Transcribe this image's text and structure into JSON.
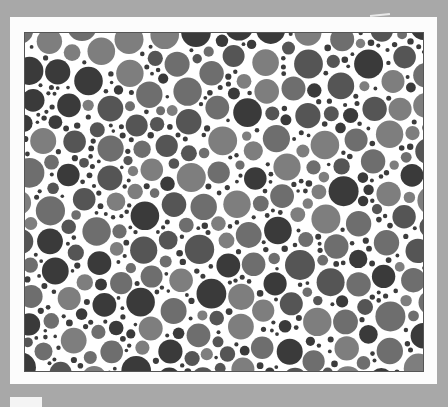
{
  "image": {
    "description": "Grayscale scan of a pseudo-isochromatic dot plate (Ishihara-style) mounted on a white card over a gray background",
    "background_color": "#a8a8a8",
    "card_color": "#fcfcfc",
    "panel_border_color": "#555555",
    "dot_palette": [
      "#3a3a3a",
      "#555555",
      "#6e6e6e",
      "#7e7e7e"
    ],
    "small_dot_color": "#3c3c3c",
    "visible_text": []
  }
}
